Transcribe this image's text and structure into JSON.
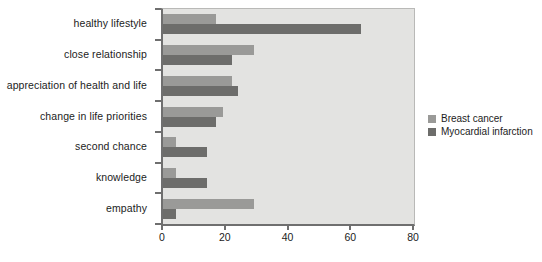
{
  "chart_data": {
    "type": "bar",
    "orientation": "horizontal",
    "title": "",
    "xlabel": "",
    "ylabel": "",
    "xlim": [
      0,
      80
    ],
    "xticks": [
      0,
      20,
      40,
      60,
      80
    ],
    "xtick_labels": [
      "0",
      "20",
      "40",
      "60",
      "80"
    ],
    "grid": false,
    "legend_position": "right",
    "categories": [
      "healthy lifestyle",
      "close relationship",
      "appreciation of health and life",
      "change in life priorities",
      "second chance",
      "knowledge",
      "empathy"
    ],
    "series": [
      {
        "name": "Breast cancer",
        "color": "#9a9a98",
        "values": [
          17,
          29,
          22,
          19,
          4,
          4,
          29
        ]
      },
      {
        "name": "Myocardial infarction",
        "color": "#6d6d6b",
        "values": [
          63,
          22,
          24,
          17,
          14,
          14,
          4
        ]
      }
    ]
  },
  "legend": {
    "entries": [
      {
        "label": "Breast cancer",
        "color": "#9a9a98"
      },
      {
        "label": "Myocardial infarction",
        "color": "#6d6d6b"
      }
    ]
  },
  "colors": {
    "plot_background": "#e3e3e1",
    "axis_line": "#6f6f6f",
    "page_background": "#ffffff",
    "text": "#1c1c1c"
  }
}
